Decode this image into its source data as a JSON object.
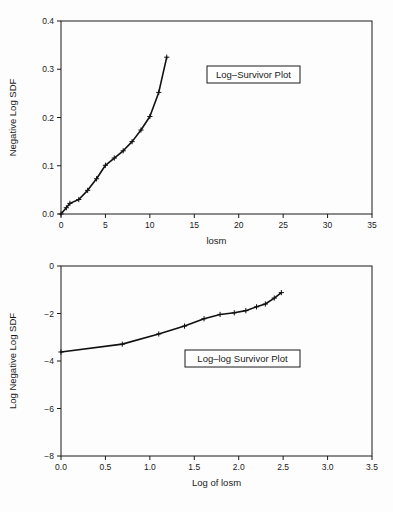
{
  "figure": {
    "background_color": "#fdfdfd",
    "line_color": "#111111",
    "axis_color": "#1a1a1a"
  },
  "panels": [
    {
      "id": "log-survivor",
      "annotation": "Log–Survivor Plot"
    },
    {
      "id": "log-log-survivor",
      "annotation": "Log–log Survivor Plot"
    }
  ],
  "chart_data": [
    {
      "type": "line",
      "id": "log-survivor-plot",
      "title": "Log–Survivor Plot",
      "xlabel": "losm",
      "ylabel": "Negative Log SDF",
      "xlim": [
        0,
        35
      ],
      "ylim": [
        0.0,
        0.4
      ],
      "xticks": [
        0,
        5,
        10,
        15,
        20,
        25,
        30,
        35
      ],
      "xticklabels": [
        "0",
        "5",
        "10",
        "15",
        "20",
        "25",
        "30",
        "35"
      ],
      "yticks": [
        0.0,
        0.1,
        0.2,
        0.3,
        0.4
      ],
      "yticklabels": [
        "0.0",
        "0.1",
        "0.2",
        "0.3",
        "0.4"
      ],
      "grid": false,
      "legend": "none",
      "marker": "plus",
      "annotation_text": "Log–Survivor Plot",
      "x": [
        0.0,
        0.6,
        1.0,
        2.0,
        3.0,
        4.0,
        5.0,
        6.0,
        7.0,
        8.0,
        9.0,
        10.0,
        11.0,
        11.9
      ],
      "y": [
        0.0,
        0.013,
        0.022,
        0.03,
        0.049,
        0.073,
        0.101,
        0.116,
        0.131,
        0.15,
        0.174,
        0.202,
        0.252,
        0.325
      ]
    },
    {
      "type": "line",
      "id": "log-log-survivor-plot",
      "title": "Log–log Survivor Plot",
      "xlabel": "Log of losm",
      "ylabel": "Log Negative Log SDF",
      "xlim": [
        0.0,
        3.5
      ],
      "ylim": [
        -8,
        0
      ],
      "xticks": [
        0.0,
        0.5,
        1.0,
        1.5,
        2.0,
        2.5,
        3.0,
        3.5
      ],
      "xticklabels": [
        "0.0",
        "0.5",
        "1.0",
        "1.5",
        "2.0",
        "2.5",
        "3.0",
        "3.5"
      ],
      "yticks": [
        -8,
        -6,
        -4,
        -2,
        0
      ],
      "yticklabels": [
        "−8",
        "−6",
        "−4",
        "−2",
        "0"
      ],
      "grid": false,
      "legend": "none",
      "marker": "plus",
      "annotation_text": "Log–log Survivor Plot",
      "x": [
        0.0,
        0.69,
        1.1,
        1.39,
        1.61,
        1.79,
        1.95,
        2.08,
        2.2,
        2.3,
        2.4,
        2.48
      ],
      "y": [
        -3.62,
        -3.29,
        -2.86,
        -2.53,
        -2.22,
        -2.04,
        -1.97,
        -1.88,
        -1.72,
        -1.6,
        -1.35,
        -1.12
      ]
    }
  ]
}
